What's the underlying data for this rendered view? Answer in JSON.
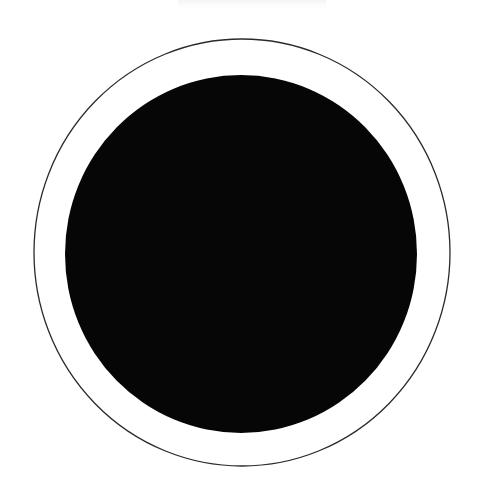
{
  "image": {
    "kind": "photograph",
    "subject": "dark circular object on white background",
    "alt_text": "A large solid black circle centered on a white background, surrounded by a thin dark outline circle slightly larger than it",
    "width": 494,
    "height": 485,
    "background_color": "#ffffff"
  },
  "elements": {
    "outer_ring": {
      "name": "outer thin circle outline",
      "center_x": 242,
      "center_y": 252.5,
      "radius_x": 208,
      "radius_y": 213.5,
      "stroke_color": "#2a2a2a",
      "stroke_width": 1.3,
      "fill": "none"
    },
    "inner_disc": {
      "name": "solid black disc",
      "center_x": 241,
      "center_y": 254,
      "radius_x": 176,
      "radius_y": 179,
      "fill_color": "#060606",
      "stroke": "none"
    },
    "top_smudge": {
      "name": "faint gray smudge at top edge",
      "x": 178,
      "y": 0,
      "width": 148,
      "height": 9,
      "color": "#f2f2f2"
    }
  },
  "colors": {
    "background": "#ffffff",
    "disc": "#060606",
    "ring_stroke": "#2a2a2a",
    "gap": "#ffffff"
  }
}
